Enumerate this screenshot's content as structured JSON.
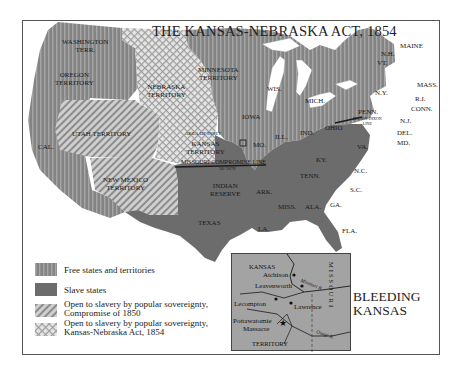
{
  "title": "THE KANSAS-NEBRASKA ACT, 1854",
  "colors": {
    "free": "#8a8a8a",
    "free_stripe": "#a8a8a8",
    "slave": "#6e6e6e",
    "compromise_1850_base": "#c8c8c8",
    "compromise_1850_stripe": "#8f8f8f",
    "kansas_nebraska_base": "#e4e4e4",
    "kansas_nebraska_check": "#9a9a9a",
    "water": "#ffffff",
    "inset_bg": "#a3a3a3"
  },
  "territories": {
    "washington": "WASHINGTON TERR.",
    "washington_l1": "WASHINGTON",
    "washington_l2": "TERR.",
    "oregon_l1": "OREGON",
    "oregon_l2": "TERRITORY",
    "nebraska_l1": "NEBRASKA",
    "nebraska_l2": "TERRITORY",
    "minnesota_l1": "MINNESOTA",
    "minnesota_l2": "TERRITORY",
    "utah": "UTAH TERRITORY",
    "cal": "CAL.",
    "kansas_l1": "KANSAS",
    "kansas_l2": "TERRITORY",
    "area_of_inset": "AREA OF INSET",
    "new_mexico_l1": "NEW MEXICO",
    "new_mexico_l2": "TERRITORY",
    "indian_l1": "INDIAN",
    "indian_l2": "RESERVE"
  },
  "states": {
    "iowa": "IOWA",
    "wis": "WIS.",
    "mich": "MICH.",
    "ill": "ILL.",
    "ind": "IND.",
    "ohio": "OHIO",
    "penn": "PENN.",
    "ny": "N.Y.",
    "vt": "VT.",
    "nh": "N.H.",
    "maine": "MAINE",
    "mass": "MASS.",
    "ri": "R.I.",
    "conn": "CONN.",
    "nj": "N.J.",
    "del": "DEL.",
    "md": "MD.",
    "va": "VA.",
    "ky": "KY.",
    "tenn": "TENN.",
    "nc": "N.C.",
    "sc": "S.C.",
    "ga": "GA.",
    "ala": "ALA.",
    "miss": "MISS.",
    "la": "LA.",
    "ark": "ARK.",
    "mo": "MO.",
    "texas": "TEXAS",
    "fla": "FLA."
  },
  "lines": {
    "missouri_compromise": "MISSOURI COMPROMISE LINE",
    "missouri_compromise_lat": "36°30'N",
    "mason_dixon_l1": "MASON-DIXON",
    "mason_dixon_l2": "LINE"
  },
  "legend": [
    {
      "key": "free",
      "label": "Free states and territories"
    },
    {
      "key": "slave",
      "label": "Slave states"
    },
    {
      "key": "compromise_1850",
      "label_l1": "Open to slavery by popular sovereignty,",
      "label_l2": "Compromise of 1850"
    },
    {
      "key": "kansas_nebraska",
      "label_l1": "Open to slavery by popular sovereignty,",
      "label_l2": "Kansas-Nebraska Act, 1854"
    }
  ],
  "inset": {
    "title": "BLEEDING KANSAS",
    "title_l1": "BLEEDING",
    "title_l2": "KANSAS",
    "kansas": "KANSAS",
    "territory": "TERRITORY",
    "missouri": "MISSOURI",
    "places": [
      "Atchison",
      "Leavenworth",
      "Lecompton",
      "Lawrence",
      "Pottawatomie",
      "Massacre"
    ],
    "rivers": [
      "Missouri R.",
      "Osage R."
    ]
  }
}
